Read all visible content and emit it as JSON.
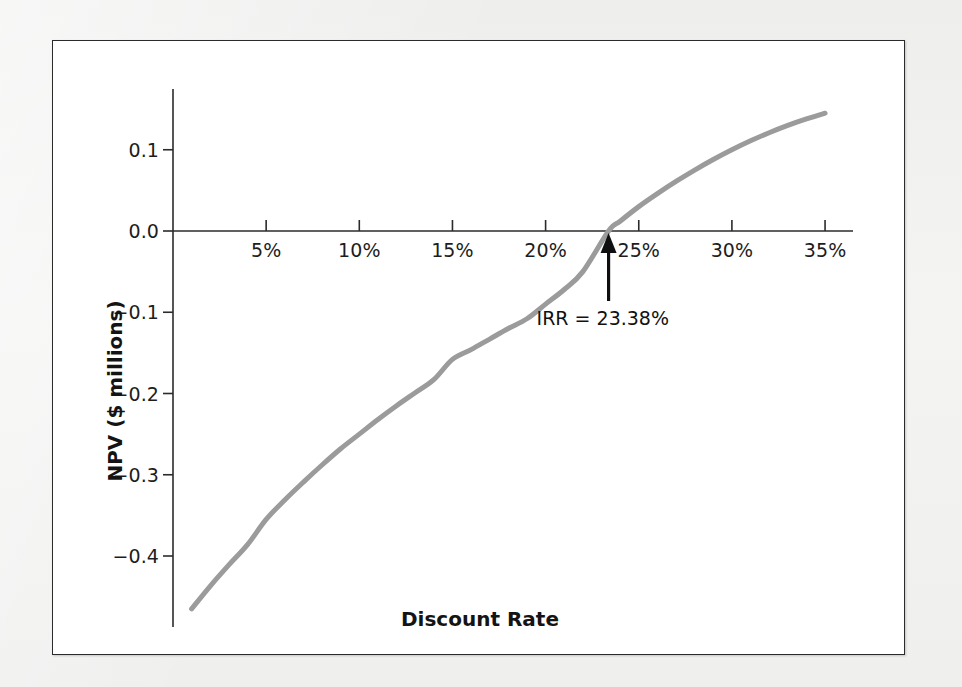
{
  "figure": {
    "background_color": "#f2f2f1",
    "panel_color": "#ffffff",
    "border_color": "#2b2b2b"
  },
  "chart_data": {
    "type": "line",
    "title": "",
    "subtitle": "",
    "xlabel": "Discount Rate",
    "ylabel": "NPV ($ millions)",
    "xlim": [
      0,
      36.5
    ],
    "ylim": [
      -0.48,
      0.16
    ],
    "grid": false,
    "legend": null,
    "legend_position": "none",
    "line_color": "#9b9b9b",
    "line_width_px": 5,
    "x_tick_labels": [
      "5%",
      "10%",
      "15%",
      "20%",
      "25%",
      "30%",
      "35%"
    ],
    "x_tick_values": [
      5,
      10,
      15,
      20,
      25,
      30,
      35
    ],
    "y_tick_labels": [
      "0.1",
      "0.0",
      "−0.1",
      "−0.2",
      "−0.3",
      "−0.4"
    ],
    "y_tick_values": [
      0.1,
      0.0,
      -0.1,
      -0.2,
      -0.3,
      -0.4
    ],
    "series": [
      {
        "name": "NPV profile",
        "x": [
          1.0,
          2.0,
          3.0,
          4.0,
          5.0,
          6.0,
          7.0,
          8.0,
          9.0,
          10.0,
          11.0,
          12.0,
          13.0,
          14.0,
          15.0,
          16.0,
          17.0,
          18.0,
          19.0,
          20.0,
          21.0,
          22.0,
          23.38,
          24.0,
          25.0,
          26.0,
          27.0,
          28.0,
          29.0,
          30.0,
          31.0,
          32.0,
          33.0,
          34.0,
          35.0
        ],
        "y": [
          -0.465,
          -0.437,
          -0.411,
          -0.386,
          -0.355,
          -0.331,
          -0.309,
          -0.288,
          -0.268,
          -0.25,
          -0.232,
          -0.215,
          -0.199,
          -0.183,
          -0.158,
          -0.146,
          -0.133,
          -0.12,
          -0.108,
          -0.09,
          -0.072,
          -0.05,
          0.0,
          0.012,
          0.03,
          0.046,
          0.061,
          0.075,
          0.088,
          0.1,
          0.111,
          0.121,
          0.13,
          0.138,
          0.145
        ]
      }
    ],
    "annotations": [
      {
        "name": "irr-marker",
        "text": "IRR = 23.38%",
        "x": 23.38,
        "y": 0.0,
        "arrow": "up",
        "arrow_color": "#0f0f0f"
      }
    ],
    "axis_zero_line": true
  }
}
